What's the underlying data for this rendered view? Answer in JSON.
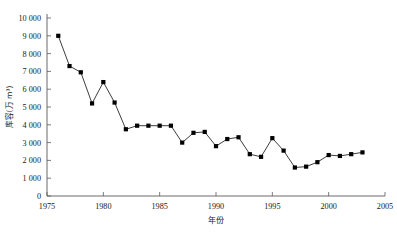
{
  "chart_data": {
    "type": "line",
    "title": "",
    "xlabel": "年份",
    "ylabel": "库容(万 m³)",
    "xlim": [
      1975,
      2005
    ],
    "ylim": [
      0,
      10000
    ],
    "xticks": [
      1975,
      1980,
      1985,
      1990,
      1995,
      2000,
      2005
    ],
    "xtick_labels": [
      "1975",
      "1980",
      "1985",
      "1990",
      "1995",
      "2000",
      "2005"
    ],
    "yticks": [
      0,
      1000,
      2000,
      3000,
      4000,
      5000,
      6000,
      7000,
      8000,
      9000,
      10000
    ],
    "ytick_labels": [
      "0",
      "1 000",
      "2 000",
      "3 000",
      "4 000",
      "5 000",
      "6 000",
      "7 000",
      "8 000",
      "9 000",
      "10 000"
    ],
    "grid": false,
    "legend": "none",
    "marker": "square",
    "marker_color": "#000000",
    "line_color": "#1a1a1a",
    "series": [
      {
        "name": "库容",
        "x": [
          1976,
          1977,
          1978,
          1979,
          1980,
          1981,
          1982,
          1983,
          1984,
          1985,
          1986,
          1987,
          1988,
          1989,
          1990,
          1991,
          1992,
          1993,
          1994,
          1995,
          1996,
          1997,
          1998,
          1999,
          2000,
          2001,
          2002,
          2003
        ],
        "values": [
          9000,
          7300,
          6950,
          5200,
          6400,
          5250,
          3750,
          3950,
          3950,
          3950,
          3950,
          3000,
          3550,
          3600,
          2800,
          3200,
          3300,
          2350,
          2200,
          3250,
          2550,
          1600,
          1650,
          1900,
          2300,
          2250,
          2350,
          2450
        ]
      }
    ]
  },
  "axes": {
    "y_axis_name": "库容轴",
    "x_axis_name": "年份轴"
  }
}
